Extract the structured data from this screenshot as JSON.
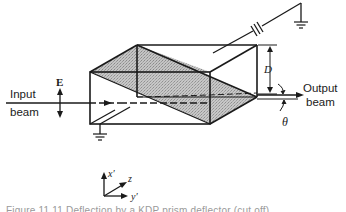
{
  "diagram": {
    "labels": {
      "field": "E",
      "input_line1": "Input",
      "input_line2": "beam",
      "output_line1": "Output",
      "output_line2": "beam",
      "dimension": "D",
      "angle": "θ"
    },
    "axes": {
      "x": "x′",
      "z": "z",
      "y": "y′"
    },
    "components": [
      "battery-source",
      "ground-top",
      "ground-bottom",
      "prism-box",
      "diagonal-interface"
    ],
    "colors": {
      "line": "#1a1a1a",
      "shade": "#b8b8b8",
      "background": "#ffffff"
    }
  },
  "caption": {
    "text": "Figure 11.11  Deflection by a KDP prism deflector (cut off)"
  }
}
